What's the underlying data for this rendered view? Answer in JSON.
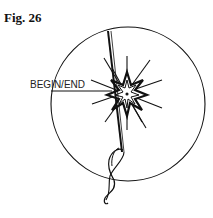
{
  "figure": {
    "label": "Fig. 26",
    "callout": "BEGIN/END"
  }
}
